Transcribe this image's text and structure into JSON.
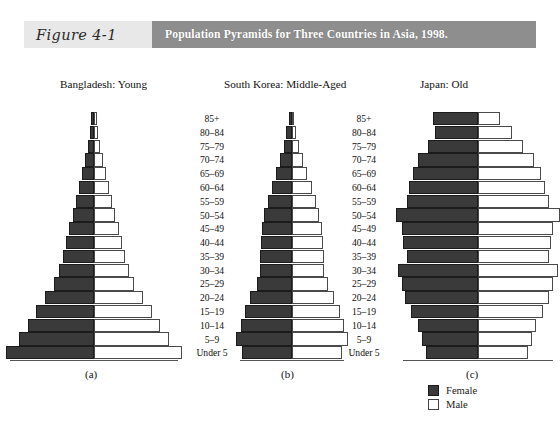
{
  "figure": {
    "number_label": "Figure 4-1",
    "title": "Population Pyramids for Three Countries in Asia, 1998."
  },
  "legend": {
    "female_label": "Female",
    "male_label": "Male",
    "female_color": "#3a3a3a",
    "male_color": "#ffffff"
  },
  "age_groups": [
    "85+",
    "80–84",
    "75–79",
    "70–74",
    "65–69",
    "60–64",
    "55–59",
    "50–54",
    "45–49",
    "40–44",
    "35–39",
    "30–34",
    "25–29",
    "20–24",
    "15–19",
    "10–14",
    "5–9",
    "Under 5"
  ],
  "sub_captions": [
    "(a)",
    "(b)",
    "(c)"
  ],
  "panel_captions": [
    "Bangladesh: Young",
    "South Korea:  Middle-Aged",
    "Japan:  Old"
  ],
  "chart_data": {
    "type": "bar",
    "chart_subtype": "population-pyramid",
    "title": "Population Pyramids for Three Countries in Asia, 1998.",
    "xlabel": "",
    "ylabel": "Age group",
    "categories": [
      "85+",
      "80–84",
      "75–79",
      "70–74",
      "65–69",
      "60–64",
      "55–59",
      "50–54",
      "45–49",
      "40–44",
      "35–39",
      "30–34",
      "25–29",
      "20–24",
      "15–19",
      "10–14",
      "5–9",
      "Under 5"
    ],
    "legend": [
      "Female",
      "Male"
    ],
    "legend_position": "bottom-right",
    "grid": false,
    "panels": [
      {
        "name": "Bangladesh: Young",
        "sub_caption": "(a)",
        "shape": "expansive triangle",
        "series": [
          {
            "name": "Female",
            "values": [
              1.0,
              1.5,
              2.2,
              3.2,
              4.4,
              5.6,
              6.8,
              8.0,
              9.2,
              10.4,
              11.6,
              13.0,
              15.0,
              18.2,
              21.6,
              24.6,
              28.0,
              33.0
            ]
          },
          {
            "name": "Male",
            "values": [
              1.0,
              1.5,
              2.2,
              3.2,
              4.4,
              5.6,
              6.8,
              8.0,
              9.2,
              10.4,
              11.6,
              13.0,
              15.0,
              18.2,
              21.6,
              24.6,
              28.0,
              33.0
            ]
          }
        ]
      },
      {
        "name": "South Korea:  Middle-Aged",
        "sub_caption": "(b)",
        "shape": "stationary with middle bulge",
        "series": [
          {
            "name": "Female",
            "values": [
              2.0,
              3.4,
              5.0,
              7.2,
              9.8,
              12.2,
              14.4,
              16.6,
              18.0,
              18.4,
              19.2,
              19.0,
              21.0,
              25.0,
              28.2,
              30.6,
              33.4,
              30.0
            ]
          },
          {
            "name": "Male",
            "values": [
              1.2,
              2.6,
              4.4,
              6.6,
              9.2,
              11.8,
              14.2,
              16.4,
              18.2,
              18.6,
              19.4,
              19.2,
              21.4,
              25.4,
              28.6,
              31.0,
              33.6,
              30.2
            ]
          }
        ]
      },
      {
        "name": "Japan:  Old",
        "sub_caption": "(c)",
        "shape": "constrictive / top-heavy",
        "series": [
          {
            "name": "Female",
            "values": [
              24.0,
              23.0,
              27.0,
              32.0,
              35.0,
              37.0,
              38.0,
              44.0,
              41.0,
              40.0,
              38.0,
              43.0,
              41.0,
              39.0,
              36.0,
              32.0,
              30.0,
              28.0
            ]
          },
          {
            "name": "Male",
            "values": [
              12.0,
              18.0,
              24.0,
              30.0,
              34.0,
              36.0,
              38.0,
              44.0,
              40.0,
              39.0,
              38.0,
              43.0,
              40.0,
              38.0,
              35.0,
              31.0,
              29.0,
              27.0
            ]
          }
        ]
      }
    ]
  }
}
